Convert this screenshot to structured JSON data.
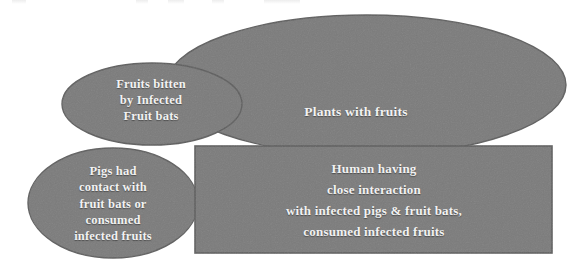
{
  "diagram": {
    "background_color": "#ffffff",
    "shape_fill_color": "#7b7b7b",
    "shape_stroke_color": "#5e5e5e",
    "label_text_color": "#f2f2f2",
    "shapes": [
      {
        "id": "plants-with-fruits",
        "type": "ellipse",
        "name": "plants-with-fruits-ellipse",
        "label": "Plants with fruits",
        "cx": 366,
        "cy": 85,
        "rx": 200,
        "ry": 70
      },
      {
        "id": "fruits-bitten",
        "type": "ellipse",
        "name": "fruits-bitten-ellipse",
        "label": "Fruits bitten\nby Infected\nFruit bats",
        "cx": 152,
        "cy": 104,
        "rx": 90,
        "ry": 41
      },
      {
        "id": "pigs-contact",
        "type": "ellipse",
        "name": "pigs-contact-ellipse",
        "label": "Pigs had\ncontact with\nfruit bats or\nconsumed\ninfected fruits",
        "cx": 113,
        "cy": 203,
        "rx": 85,
        "ry": 55
      },
      {
        "id": "human-interaction",
        "type": "rectangle",
        "name": "human-interaction-rectangle",
        "label": "Human having\nclose interaction\nwith infected pigs & fruit bats,\nconsumed infected fruits",
        "x": 195,
        "y": 146,
        "width": 357,
        "height": 107
      }
    ]
  }
}
